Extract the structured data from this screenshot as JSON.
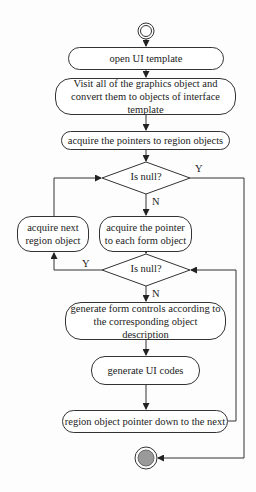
{
  "diagram": {
    "type": "activity-flowchart",
    "nodes": {
      "start": {
        "kind": "initial"
      },
      "n1": {
        "label": "open UI template"
      },
      "n2": {
        "label": "Visit all of the graphics object and convert them to objects of interface template"
      },
      "n3": {
        "label": "acquire the pointers to region objects"
      },
      "d1": {
        "label": "Is null?"
      },
      "n4": {
        "label": "acquire next region object"
      },
      "n5": {
        "label": "acquire the pointer to each form object"
      },
      "d2": {
        "label": "Is null?"
      },
      "n6": {
        "label": "generate form controls according to the corresponding object description"
      },
      "n7": {
        "label": "generate UI codes"
      },
      "n8": {
        "label": "region object pointer down to the next"
      },
      "end": {
        "kind": "final"
      }
    },
    "edge_labels": {
      "d1_yes": "Y",
      "d1_no": "N",
      "d2_yes": "Y",
      "d2_no": "N"
    },
    "edges": [
      [
        "start",
        "n1"
      ],
      [
        "n1",
        "n2"
      ],
      [
        "n2",
        "n3"
      ],
      [
        "n3",
        "d1"
      ],
      [
        "d1",
        "n5",
        "N"
      ],
      [
        "d1",
        "end",
        "Y"
      ],
      [
        "n5",
        "d2"
      ],
      [
        "d2",
        "n6",
        "N"
      ],
      [
        "d2",
        "n4",
        "Y"
      ],
      [
        "n4",
        "d1"
      ],
      [
        "n6",
        "n7"
      ],
      [
        "n7",
        "n8"
      ],
      [
        "n8",
        "d2"
      ]
    ],
    "colors": {
      "line": "#333333",
      "final_fill": "#9a9a9a"
    }
  }
}
